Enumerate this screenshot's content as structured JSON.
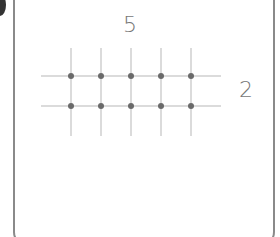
{
  "figure": {
    "columns_label": "5",
    "rows_label": "2",
    "columns": 5,
    "rows": 2,
    "colors": {
      "grid": "#cfcfcf",
      "dot": "#6a6a6a",
      "label": "#777777",
      "border": "#8a8a8a"
    }
  }
}
